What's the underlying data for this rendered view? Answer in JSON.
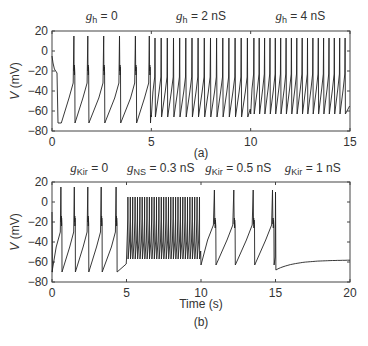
{
  "chart_data": [
    {
      "type": "line",
      "panel_label": "(a)",
      "title": "",
      "xlabel": "",
      "ylabel": "V (mV)",
      "xlim": [
        0,
        15
      ],
      "ylim": [
        -80,
        20
      ],
      "xticks": [
        0,
        5,
        10,
        15
      ],
      "yticks": [
        -80,
        -60,
        -40,
        -20,
        0,
        20
      ],
      "grid": false,
      "annotations": [
        {
          "g": "g",
          "sub": "h",
          "text": " = 0",
          "x": 2.5
        },
        {
          "g": "g",
          "sub": "h",
          "text": " = 2 nS",
          "x": 7.5
        },
        {
          "g": "g",
          "sub": "h",
          "text": " = 4 nS",
          "x": 12.5
        }
      ],
      "segments": [
        {
          "label": "g_h = 0",
          "t_start": 0,
          "t_end": 5,
          "spike_times": [
            1.1,
            1.8,
            2.6,
            3.4,
            4.2,
            4.9
          ],
          "spike_peak": 15,
          "shoulder": -20,
          "trough": -72,
          "initial_transient": true
        },
        {
          "label": "g_h = 2 nS",
          "t_start": 5,
          "t_end": 10,
          "spike_interval": 0.31,
          "spike_peak": 13,
          "trough": -66
        },
        {
          "label": "g_h = 4 nS",
          "t_start": 10,
          "t_end": 15,
          "spike_interval": 0.27,
          "spike_peak": 13,
          "trough": -63
        }
      ]
    },
    {
      "type": "line",
      "panel_label": "(b)",
      "title": "",
      "xlabel": "Time (s)",
      "ylabel": "V (mV)",
      "xlim": [
        0,
        20
      ],
      "ylim": [
        -80,
        20
      ],
      "xticks": [
        0,
        5,
        10,
        15,
        20
      ],
      "yticks": [
        -80,
        -60,
        -40,
        -20,
        0,
        20
      ],
      "grid": false,
      "annotations": [
        {
          "g": "g",
          "sub": "Kir",
          "text": " = 0",
          "x": 2.5
        },
        {
          "g": "g",
          "sub": "NS",
          "text": " = 0.3 nS",
          "x": 7.3
        },
        {
          "g": "g",
          "sub": "Kir",
          "text": " = 0.5 nS",
          "x": 12.5
        },
        {
          "g": "g",
          "sub": "Kir",
          "text": " = 1 nS",
          "x": 17.5
        }
      ],
      "segments": [
        {
          "label": "g_Kir = 0",
          "t_start": 0,
          "t_end": 5,
          "spike_times": [
            0.6,
            1.5,
            2.4,
            3.3,
            4.3
          ],
          "spike_peak": 15,
          "shoulder": -20,
          "trough": -70
        },
        {
          "label": "g_NS = 0.3 nS",
          "t_start": 5,
          "t_end": 10,
          "spike_interval": 0.16,
          "spike_peak": 5,
          "trough": -57
        },
        {
          "label": "g_Kir = 0.5 nS",
          "t_start": 10,
          "t_end": 15,
          "spike_times": [
            10.9,
            12.2,
            13.5,
            14.8
          ],
          "spike_peak": 12,
          "shoulder": -22,
          "trough": -63
        },
        {
          "label": "g_Kir = 1 nS",
          "t_start": 15,
          "t_end": 20,
          "settle_from": -68,
          "settle_to": -58
        }
      ]
    }
  ],
  "panels": {
    "a": {
      "label": "(a)",
      "ylabel": "V (mV)"
    },
    "b": {
      "label": "(b)",
      "ylabel": "V (mV)",
      "xlabel": "Time (s)"
    }
  }
}
